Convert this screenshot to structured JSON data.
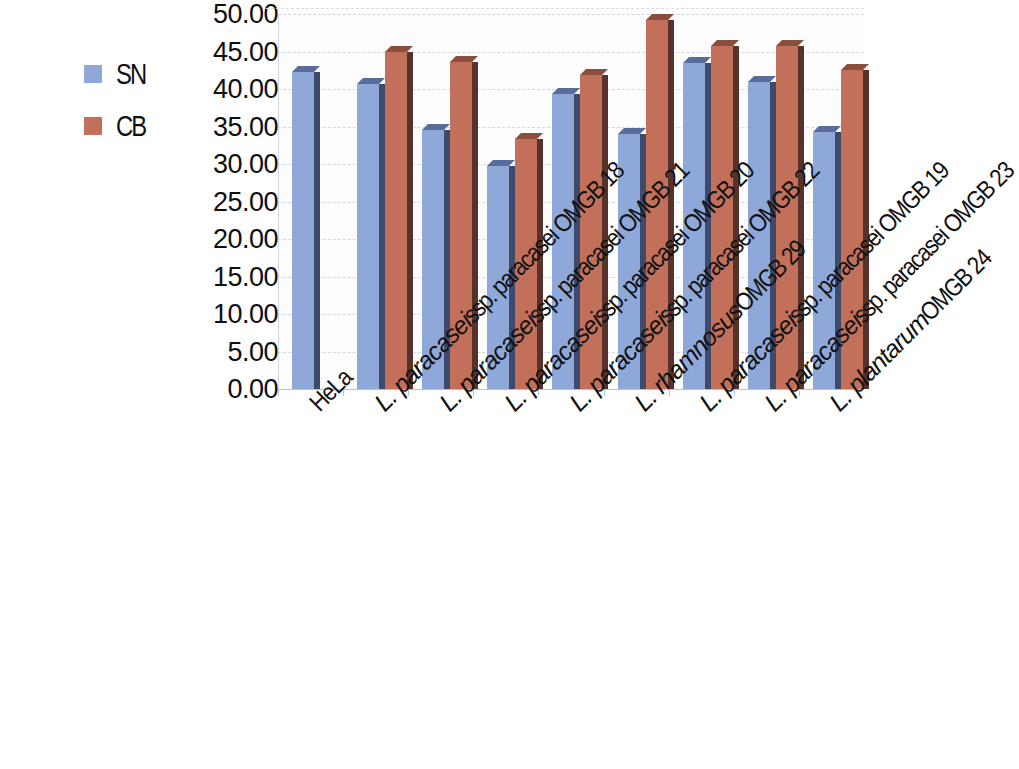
{
  "chart_data": {
    "type": "bar",
    "title": "",
    "subtitle": "",
    "xlabel": "",
    "ylabel": "",
    "ylim": [
      0,
      50
    ],
    "ytick_step": 5,
    "ytick_labels": [
      "50.00",
      "45.00",
      "40.00",
      "35.00",
      "30.00",
      "25.00",
      "20.00",
      "15.00",
      "10.00",
      "5.00",
      "0.00"
    ],
    "ytick_values": [
      50,
      45,
      40,
      35,
      30,
      25,
      20,
      15,
      10,
      5,
      0
    ],
    "grid": true,
    "grid_axis": "y",
    "legend_position": "left-outside",
    "three_d": true,
    "categories": [
      "HeLa",
      "L. paracasei ssp. paracasei OMGB 18",
      "L. paracasei ssp. paracasei OMGB 21",
      "L. paracasei ssp. paracasei OMGB 20",
      "L. paracasei ssp. paracasei OMGB 22",
      "L. rhamnosus OMGB 29",
      "L. paracasei ssp. paracasei OMGB 19",
      "L. paracasei ssp. paracasei OMGB 23",
      "L. plantarum OMGB 24"
    ],
    "category_parts": [
      {
        "italic": "",
        "rest": "HeLa"
      },
      {
        "italic": "L. paracasei",
        "rest": " ssp. paracasei OMGB 18"
      },
      {
        "italic": "L. paracasei",
        "rest": " ssp. paracasei OMGB 21"
      },
      {
        "italic": "L. paracasei",
        "rest": " ssp. paracasei OMGB 20"
      },
      {
        "italic": "L. paracasei",
        "rest": " ssp. paracasei OMGB 22"
      },
      {
        "italic": "L. rhamnosus",
        "rest": " OMGB 29"
      },
      {
        "italic": "L. paracasei",
        "rest": " ssp. paracasei OMGB 19"
      },
      {
        "italic": "L. paracasei",
        "rest": " ssp. paracasei OMGB 23"
      },
      {
        "italic": "L. plantarum",
        "rest": " OMGB 24"
      }
    ],
    "series": [
      {
        "name": "SN",
        "color": "#8fa8da",
        "values": [
          42.3,
          40.7,
          34.5,
          29.7,
          39.4,
          34.0,
          43.5,
          41.0,
          34.3
        ]
      },
      {
        "name": "CB",
        "color": "#c3705a",
        "values": [
          null,
          45.0,
          43.6,
          33.4,
          41.9,
          49.2,
          45.8,
          45.8,
          42.6
        ]
      }
    ]
  },
  "legend": {
    "items": [
      {
        "label": "SN",
        "color": "#8fa8da"
      },
      {
        "label": "CB",
        "color": "#c3705a"
      }
    ]
  }
}
